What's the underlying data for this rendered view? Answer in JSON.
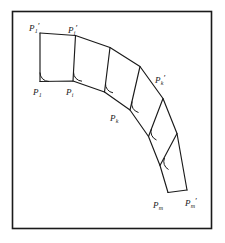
{
  "figure": {
    "caption": "",
    "frame": {
      "color": "#1a1a1a",
      "x": 12,
      "y": 11,
      "width": 200,
      "height": 218
    },
    "stroke_color": "#1a1a1a",
    "labels": [
      {
        "id": "p1-prime",
        "base": "P",
        "sub": "1",
        "prime": "′",
        "x": 31,
        "y": 25
      },
      {
        "id": "p2-prime",
        "base": "P",
        "sub": "i",
        "prime": "′",
        "x": 68,
        "y": 27
      },
      {
        "id": "p1",
        "base": "P",
        "sub": "1",
        "prime": "",
        "x": 30,
        "y": 85
      },
      {
        "id": "p2",
        "base": "P",
        "sub": "i",
        "prime": "",
        "x": 63,
        "y": 85
      },
      {
        "id": "pk-prime",
        "base": "P",
        "sub": "k",
        "prime": "′",
        "x": 152,
        "y": 75
      },
      {
        "id": "pk",
        "base": "P",
        "sub": "k",
        "prime": "",
        "x": 110,
        "y": 113
      },
      {
        "id": "pm",
        "base": "P",
        "sub": "m",
        "prime": "",
        "x": 152,
        "y": 198
      },
      {
        "id": "pm-prime",
        "base": "P",
        "sub": "m",
        "prime": "′",
        "x": 183,
        "y": 196
      }
    ],
    "base_polyline": [
      [
        40,
        81
      ],
      [
        73,
        81
      ],
      [
        104,
        92
      ],
      [
        130,
        110
      ],
      [
        148,
        136
      ],
      [
        160,
        165
      ],
      [
        168,
        192
      ]
    ],
    "offset_polyline": [
      [
        40,
        33
      ],
      [
        75,
        35
      ],
      [
        110,
        47
      ],
      [
        140,
        66
      ],
      [
        163,
        98
      ],
      [
        177,
        133
      ],
      [
        187,
        190
      ]
    ],
    "rib_segments": [
      {
        "from": [
          40,
          81
        ],
        "to": [
          40,
          33
        ]
      },
      {
        "from": [
          73,
          81
        ],
        "to": [
          75,
          35
        ]
      },
      {
        "from": [
          104,
          92
        ],
        "to": [
          110,
          47
        ]
      },
      {
        "from": [
          130,
          110
        ],
        "to": [
          140,
          66
        ]
      },
      {
        "from": [
          148,
          136
        ],
        "to": [
          163,
          98
        ]
      },
      {
        "from": [
          160,
          165
        ],
        "to": [
          177,
          133
        ]
      },
      {
        "from": [
          168,
          192
        ],
        "to": [
          187,
          190
        ]
      }
    ],
    "right_angle_marks": [
      {
        "at": [
          40,
          81
        ]
      },
      {
        "at": [
          73,
          81
        ]
      },
      {
        "at": [
          104,
          92
        ]
      },
      {
        "at": [
          130,
          110
        ]
      },
      {
        "at": [
          148,
          136
        ]
      },
      {
        "at": [
          160,
          165
        ]
      }
    ]
  }
}
